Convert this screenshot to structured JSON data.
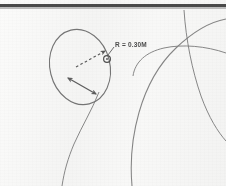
{
  "figure": {
    "title": "Scanned engineering sketch",
    "background_color": "#f7f7f6",
    "ink_color": "#6e6e6e",
    "label_color": "#4d4d4d",
    "rule_color": "#4a4a4a",
    "width": 226,
    "height": 186
  },
  "annotations": {
    "radius_label": "R = 0.30M"
  },
  "icons": {
    "center_marker": "circle-marker-icon",
    "radius_arrow": "dashed-arrow-icon",
    "span_arrow": "double-headed-arrow-icon"
  },
  "geometry": {
    "oval": {
      "name": "primary-oval",
      "cx": 80,
      "cy": 67,
      "rx": 30,
      "ry": 38,
      "rotation": -14
    },
    "center_marker": {
      "name": "radius-center-marker",
      "cx": 107,
      "cy": 59,
      "r": 3.4
    },
    "radius_arrow": {
      "name": "radius-dimension-arrow",
      "from": [
        76,
        66
      ],
      "to": [
        108,
        50
      ],
      "dashed": true
    },
    "span_arrow": {
      "name": "span-dimension-arrow",
      "from": [
        68,
        78
      ],
      "to": [
        96,
        94
      ],
      "double_headed": true
    },
    "arcs": [
      {
        "name": "right-large-arc"
      },
      {
        "name": "right-vertical-arc"
      },
      {
        "name": "lower-left-arc"
      },
      {
        "name": "far-right-arc"
      }
    ]
  }
}
